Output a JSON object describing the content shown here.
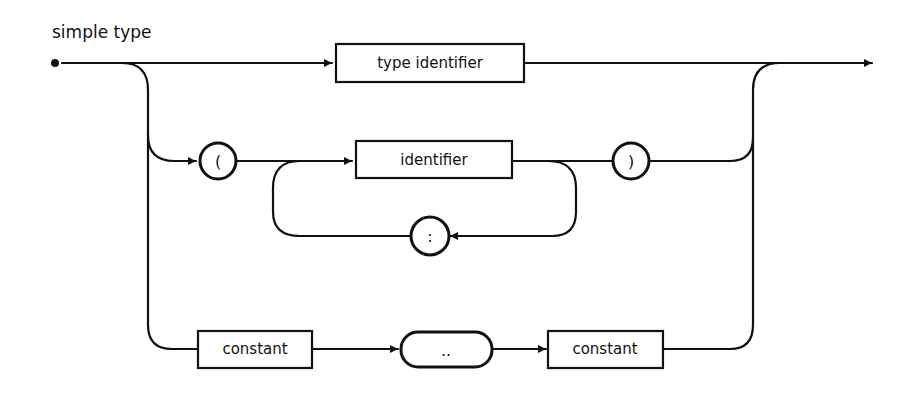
{
  "title": "simple type",
  "colors": {
    "ink": "#111111",
    "background": "#ffffff"
  },
  "nodes": {
    "type_identifier": {
      "label": "type identifier",
      "shape": "box"
    },
    "open_paren": {
      "label": "(",
      "shape": "circle"
    },
    "identifier": {
      "label": "identifier",
      "shape": "box"
    },
    "close_paren": {
      "label": ")",
      "shape": "circle"
    },
    "comma": {
      "label": ":",
      "shape": "circle"
    },
    "constant_1": {
      "label": "constant",
      "shape": "box"
    },
    "range": {
      "label": "..",
      "shape": "pill"
    },
    "constant_2": {
      "label": "constant",
      "shape": "box"
    }
  },
  "paths": [
    [
      "start",
      "type_identifier",
      "end"
    ],
    [
      "start",
      "open_paren",
      "identifier",
      "close_paren",
      "end"
    ],
    [
      "identifier",
      "comma",
      "identifier"
    ],
    [
      "start",
      "constant_1",
      "range",
      "constant_2",
      "end"
    ]
  ]
}
